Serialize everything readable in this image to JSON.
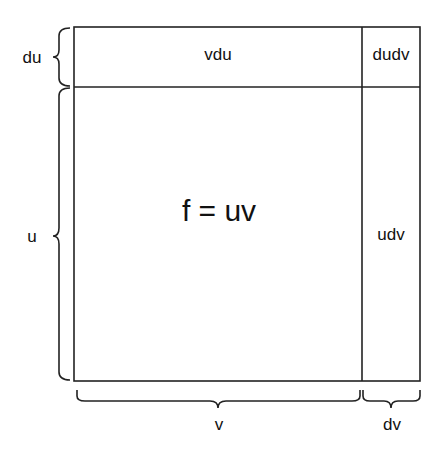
{
  "diagram": {
    "regions": {
      "main": "f = uv",
      "top": "vdu",
      "corner": "dudv",
      "right": "udv"
    },
    "braces": {
      "left_top": "du",
      "left_main": "u",
      "bottom_main": "v",
      "bottom_right": "dv"
    },
    "colors": {
      "stroke": "#222222",
      "background": "#ffffff"
    }
  }
}
